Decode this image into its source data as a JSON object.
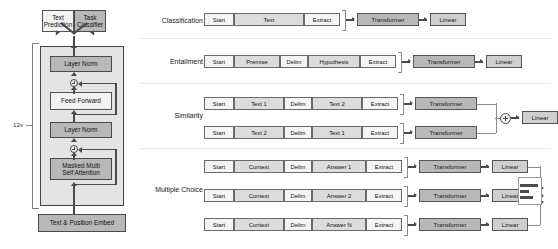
{
  "figure": {
    "type": "diagram"
  },
  "left_panel": {
    "heads": [
      {
        "label": "Text\nPrediction",
        "name": "text-prediction-head"
      },
      {
        "label": "Task\nClassifier",
        "name": "task-classifier-head"
      }
    ],
    "head_lines": [
      "Text",
      "Prediction",
      "Task",
      "Classifier"
    ],
    "repeat_label": "12x",
    "stack": [
      {
        "label": "Layer Norm",
        "style": "dark"
      },
      {
        "label": "Feed Forward",
        "style": "light"
      },
      {
        "label": "Layer Norm",
        "style": "dark"
      },
      {
        "label": "Masked Multi Self Attention",
        "lines": [
          "Masked Multi",
          "Self Attention"
        ],
        "style": "dark"
      }
    ],
    "embed": {
      "label": "Text & Position Embed"
    },
    "residual_add_symbol": "+"
  },
  "right_panel": {
    "sections": [
      {
        "name": "classification",
        "label": "Classification",
        "rows": [
          {
            "tokens": [
              "Start",
              "Text",
              "Extract"
            ],
            "modules": [
              "Transformer",
              "Linear"
            ]
          }
        ]
      },
      {
        "name": "entailment",
        "label": "Entailment",
        "rows": [
          {
            "tokens": [
              "Start",
              "Premise",
              "Delim",
              "Hypothesis",
              "Extract"
            ],
            "modules": [
              "Transformer",
              "Linear"
            ]
          }
        ]
      },
      {
        "name": "similarity",
        "label": "Similarity",
        "merge": "+",
        "merge_output": "Linear",
        "rows": [
          {
            "tokens": [
              "Start",
              "Text 1",
              "Delim",
              "Text 2",
              "Extract"
            ],
            "modules": [
              "Transformer"
            ]
          },
          {
            "tokens": [
              "Start",
              "Text 2",
              "Delim",
              "Text 1",
              "Extract"
            ],
            "modules": [
              "Transformer"
            ]
          }
        ]
      },
      {
        "name": "multiple-choice",
        "label": "Multiple Choice",
        "output_widget": "softmax-bar-chart",
        "rows": [
          {
            "tokens": [
              "Start",
              "Context",
              "Delim",
              "Answer 1",
              "Extract"
            ],
            "modules": [
              "Transformer",
              "Linear"
            ]
          },
          {
            "tokens": [
              "Start",
              "Context",
              "Delim",
              "Answer 2",
              "Extract"
            ],
            "modules": [
              "Transformer",
              "Linear"
            ]
          },
          {
            "tokens": [
              "Start",
              "Context",
              "Delim",
              "Answer N",
              "Extract"
            ],
            "modules": [
              "Transformer",
              "Linear"
            ]
          }
        ]
      }
    ]
  },
  "colors": {
    "dark_block": "#b8b8b8",
    "light_block": "#f2f2f2",
    "linear_block": "#cfcfcf",
    "token_block": "#f4f4f4",
    "token_mid_block": "#dcdcdc",
    "outline": "#4a4a4a",
    "divider": "#e8e8e8",
    "panel_bg": "#e4e4e4",
    "page_bg": "#ffffff"
  }
}
